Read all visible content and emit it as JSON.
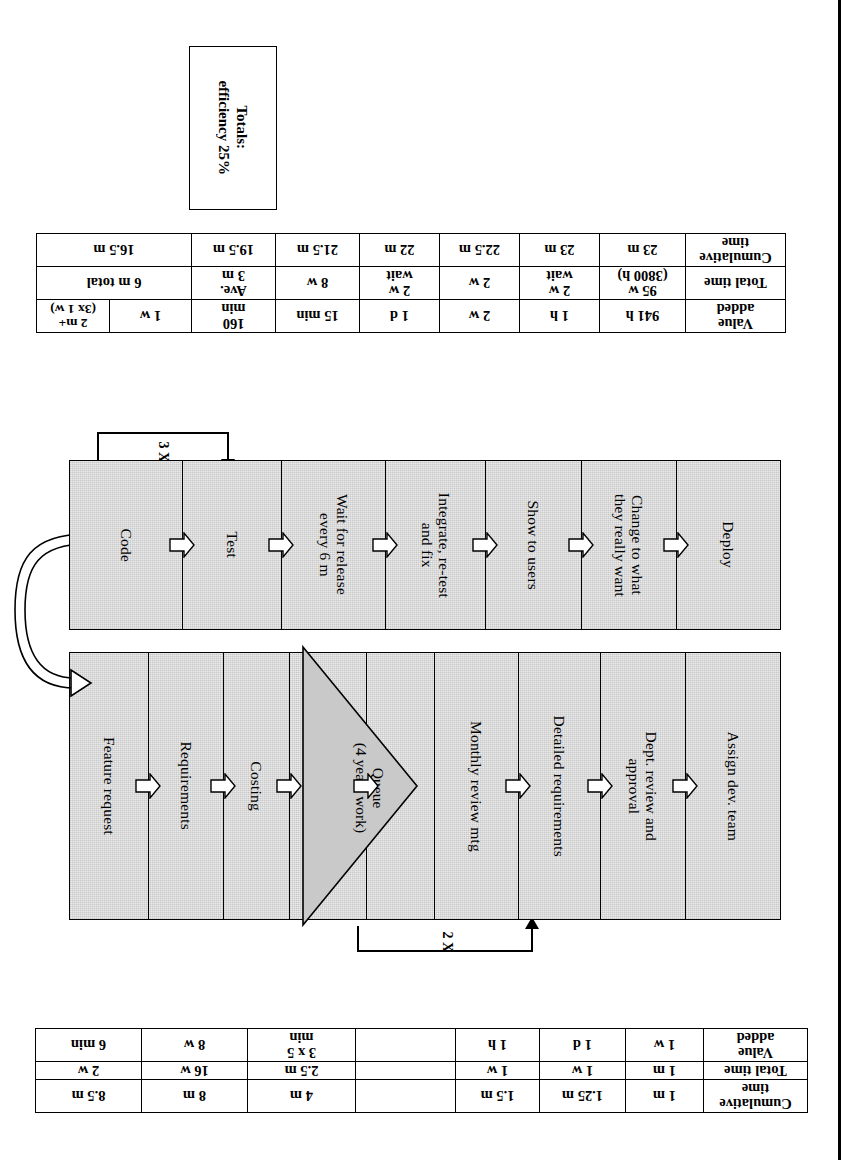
{
  "figure": {
    "orientation_note": "figure printed upside-down (rotated 180 degrees)",
    "fill_color": "#c9c9c9",
    "line_color": "#000000"
  },
  "upper_table": {
    "row_labels": {
      "value_added": "Value\nadded",
      "total_time": "Total time",
      "cumulative_time": "Cumulative\ntime"
    },
    "columns": [
      {
        "value_added": "2 m+\n(3x 1 w)",
        "total_time": "6 m total",
        "cumulative_time": "16.5 m",
        "total_time_span": 2,
        "cumulative_time_span": 2
      },
      {
        "value_added": "1 w",
        "total_time": "",
        "cumulative_time": ""
      },
      {
        "value_added": "160\nmin",
        "total_time": "Ave.\n3 m",
        "cumulative_time": "19.5 m"
      },
      {
        "value_added": "15 min",
        "total_time": "8 w",
        "cumulative_time": "21.5 m"
      },
      {
        "value_added": "1 d",
        "total_time": "2 w\nwait",
        "cumulative_time": "22 m"
      },
      {
        "value_added": "2 w",
        "total_time": "2 w",
        "cumulative_time": "22.5 m"
      },
      {
        "value_added": "1 h",
        "total_time": "2 w\nwait",
        "cumulative_time": "23 m"
      },
      {
        "value_added": "941 h",
        "total_time": "95 w\n(3800 h)",
        "cumulative_time": "23 m"
      }
    ],
    "totals_cell": "Totals:\nefficiency 25%"
  },
  "lower_table": {
    "row_labels": {
      "value_added": "Value\nadded",
      "total_time": "Total time",
      "cumulative_time": "Cumulative\ntime"
    },
    "columns": [
      {
        "value_added": "5 min",
        "total_time": "2 m",
        "cumulative_time": "10.5 m"
      },
      {
        "value_added": "6 min",
        "total_time": "2 w",
        "cumulative_time": "8.5 m"
      },
      {
        "value_added": "8 w",
        "total_time": "16 w",
        "cumulative_time": "8 m"
      },
      {
        "value_added": "3 x 5\nmin",
        "total_time": "2.5 m",
        "cumulative_time": "4 m"
      },
      {
        "value_added": "",
        "total_time": "",
        "cumulative_time": ""
      },
      {
        "value_added": "1 h",
        "total_time": "1 w",
        "cumulative_time": "1.5 m"
      },
      {
        "value_added": "1 d",
        "total_time": "1 w",
        "cumulative_time": "1.25 m"
      },
      {
        "value_added": "1 w",
        "total_time": "1 m",
        "cumulative_time": "1 m"
      }
    ]
  },
  "upper_band": {
    "steps": [
      {
        "label": "Code",
        "arrow_in": false
      },
      {
        "label": "Test",
        "arrow_in": true
      },
      {
        "label": "Wait for release\nevery 6 m",
        "arrow_in": true
      },
      {
        "label": "Integrate, re-test\nand fix",
        "arrow_in": true
      },
      {
        "label": "Show to users",
        "arrow_in": true
      },
      {
        "label": "Change to what\nthey really want",
        "arrow_in": true
      },
      {
        "label": "Deploy",
        "arrow_in": true
      }
    ],
    "loop_label": "3 X"
  },
  "lower_band": {
    "steps_left": [
      {
        "label": "Feature request",
        "arrow_in": false
      },
      {
        "label": "Requirements",
        "arrow_in": true
      },
      {
        "label": "Costing",
        "arrow_in": true
      },
      {
        "label": "Impact analysis",
        "arrow_in": true
      }
    ],
    "queue": {
      "label": "Queue\n(4 years work)"
    },
    "steps_right": [
      {
        "label": "Monthly review mtg",
        "arrow_in": true
      },
      {
        "label": "Detailed requirements",
        "arrow_in": true
      },
      {
        "label": "Dept. review and\napproval",
        "arrow_in": true
      },
      {
        "label": "Assign dev. team",
        "arrow_in": true
      }
    ],
    "loop_label": "2 X"
  }
}
